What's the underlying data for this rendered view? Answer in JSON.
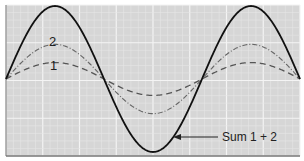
{
  "chart_data": {
    "type": "line",
    "title": "",
    "xlabel": "",
    "ylabel": "",
    "grid": true,
    "legend": "inline labels",
    "x_range": [
      0,
      1.5
    ],
    "y_range": [
      -1.1,
      1.1
    ],
    "series": [
      {
        "name": "1",
        "style": "dashed",
        "amplitude": 0.25,
        "cycles": 1.5,
        "color": "#555555"
      },
      {
        "name": "2",
        "style": "dash-dot",
        "amplitude": 0.5,
        "cycles": 1.5,
        "color": "#666666"
      },
      {
        "name": "Sum 1 + 2",
        "style": "solid",
        "amplitude": 1.0,
        "cycles": 1.5,
        "color": "#111111"
      }
    ],
    "annotations": [
      {
        "text": "Sum 1 + 2",
        "arrow_to": "Sum curve near trough"
      },
      {
        "text": "2",
        "near": "wave 2 peak"
      },
      {
        "text": "1",
        "near": "wave 1 peak"
      }
    ]
  },
  "labels": {
    "wave1": "1",
    "wave2": "2",
    "sum": "Sum 1 + 2"
  },
  "colors": {
    "background": "#d4d4d4",
    "grid": "#eeeeee",
    "axis": "#666666"
  }
}
